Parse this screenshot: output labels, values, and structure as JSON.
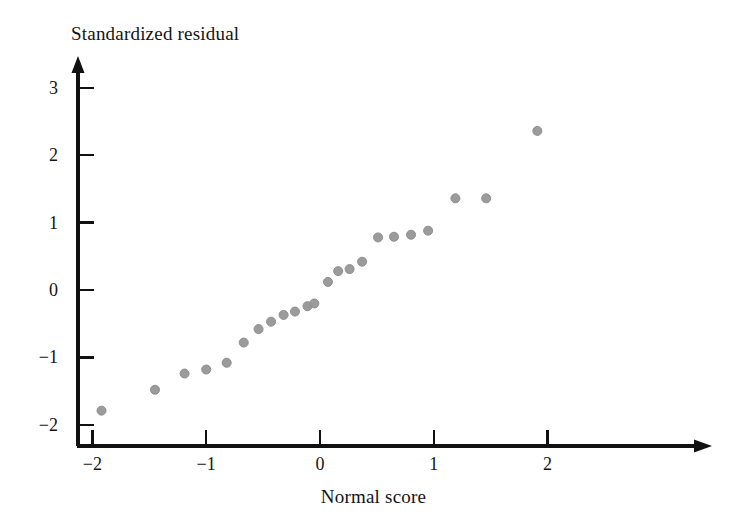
{
  "chart_data": {
    "type": "scatter",
    "title": "",
    "xlabel": "Normal score",
    "ylabel": "Standardized residual",
    "xlim": [
      -2.3,
      2.35
    ],
    "ylim": [
      -2.0,
      3.35
    ],
    "grid": false,
    "legend": null,
    "xticks": [
      -2,
      -1,
      0,
      1,
      2
    ],
    "xtick_labels": [
      "−2",
      "−1",
      "0",
      "1",
      "2"
    ],
    "yticks": [
      -2,
      -1,
      0,
      1,
      2,
      3
    ],
    "ytick_labels": [
      "−2",
      "−1",
      "0",
      "1",
      "2",
      "3"
    ],
    "marker": {
      "shape": "circle",
      "color": "#9b9b9b",
      "edge_color": "#8e8e8e",
      "size_px": 9
    },
    "axis_color": "#111111",
    "background": "#ffffff",
    "x": [
      -1.92,
      -1.45,
      -1.19,
      -1.0,
      -0.82,
      -0.67,
      -0.54,
      -0.43,
      -0.32,
      -0.22,
      -0.11,
      -0.05,
      0.07,
      0.16,
      0.26,
      0.37,
      0.51,
      0.65,
      0.8,
      0.95,
      1.19,
      1.46,
      1.91
    ],
    "y": [
      -1.79,
      -1.48,
      -1.24,
      -1.18,
      -1.08,
      -0.78,
      -0.58,
      -0.47,
      -0.37,
      -0.32,
      -0.24,
      -0.2,
      0.12,
      0.28,
      0.31,
      0.42,
      0.78,
      0.79,
      0.82,
      0.88,
      1.36,
      1.36,
      2.36
    ],
    "points": [
      {
        "x": -1.92,
        "y": -1.79
      },
      {
        "x": -1.45,
        "y": -1.48
      },
      {
        "x": -1.19,
        "y": -1.24
      },
      {
        "x": -1.0,
        "y": -1.18
      },
      {
        "x": -0.82,
        "y": -1.08
      },
      {
        "x": -0.67,
        "y": -0.78
      },
      {
        "x": -0.54,
        "y": -0.58
      },
      {
        "x": -0.43,
        "y": -0.47
      },
      {
        "x": -0.32,
        "y": -0.37
      },
      {
        "x": -0.22,
        "y": -0.32
      },
      {
        "x": -0.11,
        "y": -0.24
      },
      {
        "x": -0.05,
        "y": -0.2
      },
      {
        "x": 0.07,
        "y": 0.12
      },
      {
        "x": 0.16,
        "y": 0.28
      },
      {
        "x": 0.26,
        "y": 0.31
      },
      {
        "x": 0.37,
        "y": 0.42
      },
      {
        "x": 0.51,
        "y": 0.78
      },
      {
        "x": 0.65,
        "y": 0.79
      },
      {
        "x": 0.8,
        "y": 0.82
      },
      {
        "x": 0.95,
        "y": 0.88
      },
      {
        "x": 1.19,
        "y": 1.36
      },
      {
        "x": 1.46,
        "y": 1.36
      },
      {
        "x": 1.91,
        "y": 2.36
      }
    ]
  }
}
